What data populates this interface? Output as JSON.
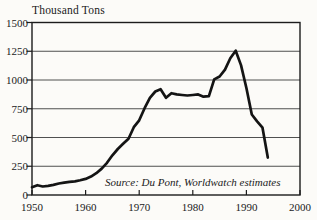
{
  "chart_data": {
    "type": "line",
    "title": "Thousand Tons",
    "source_note": "Source: Du Pont, Worldwatch estimates",
    "xlabel": "",
    "ylabel": "Thousand Tons",
    "xlim": [
      1950,
      2000
    ],
    "ylim": [
      0,
      1500
    ],
    "xticks": [
      1950,
      1960,
      1970,
      1980,
      1990,
      2000
    ],
    "yticks": [
      0,
      250,
      500,
      750,
      1000,
      1250,
      1500
    ],
    "grid": "horizontal",
    "legend": "none",
    "line_color": "#141414",
    "axis_color": "#1c1c1c",
    "grid_color": "#3c3c3c",
    "background_color": "#fcfbf8",
    "years": [
      1950,
      1951,
      1952,
      1953,
      1954,
      1955,
      1956,
      1957,
      1958,
      1959,
      1960,
      1961,
      1962,
      1963,
      1964,
      1965,
      1966,
      1967,
      1968,
      1969,
      1970,
      1971,
      1972,
      1973,
      1974,
      1975,
      1976,
      1977,
      1978,
      1979,
      1980,
      1981,
      1982,
      1983,
      1984,
      1985,
      1986,
      1987,
      1988,
      1989,
      1990,
      1991,
      1992,
      1993,
      1994
    ],
    "values": [
      68,
      85,
      74,
      80,
      88,
      100,
      108,
      115,
      118,
      128,
      140,
      160,
      190,
      230,
      280,
      345,
      400,
      445,
      490,
      590,
      650,
      755,
      845,
      900,
      920,
      845,
      885,
      875,
      870,
      865,
      870,
      875,
      855,
      860,
      1005,
      1030,
      1090,
      1190,
      1255,
      1130,
      930,
      700,
      640,
      585,
      325
    ]
  }
}
